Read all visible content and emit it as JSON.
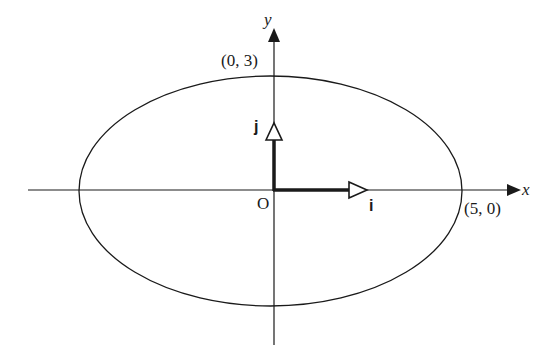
{
  "diagram": {
    "type": "ellipse-with-unit-vectors",
    "colors": {
      "background": "#ffffff",
      "ink": "#1a1a1a"
    },
    "axes": {
      "x_label": "x",
      "y_label": "y"
    },
    "origin_label": "O",
    "ellipse": {
      "semi_major_label_point": "(5, 0)",
      "semi_minor_label_point": "(0, 3)",
      "a": 5,
      "b": 3
    },
    "unit_vectors": {
      "i_label": "i",
      "j_label": "j"
    }
  }
}
